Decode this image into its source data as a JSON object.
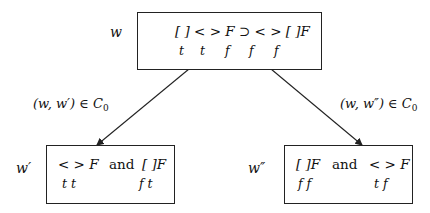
{
  "nodes": {
    "root": {
      "world": "w",
      "formula": "[ ] < > F ⊃ < > [ ]F",
      "values": [
        "t",
        "t",
        "f",
        "f",
        "f"
      ]
    },
    "left": {
      "world": "w′",
      "formula_a": "< > F",
      "connector": "and",
      "formula_b": "[ ]F",
      "values_a": "t t",
      "values_b": "f t"
    },
    "right": {
      "world": "w″",
      "formula_a": "[ ]F",
      "connector": "and",
      "formula_b": "< > F",
      "values_a": "f f",
      "values_b": "t f"
    }
  },
  "edges": {
    "left": {
      "pair": "(w, w′) ∈ C",
      "sub": "0"
    },
    "right": {
      "pair": "(w, w″) ∈ C",
      "sub": "0"
    }
  },
  "colors": {
    "line": "#222222",
    "text": "#111111",
    "background": "#ffffff"
  }
}
